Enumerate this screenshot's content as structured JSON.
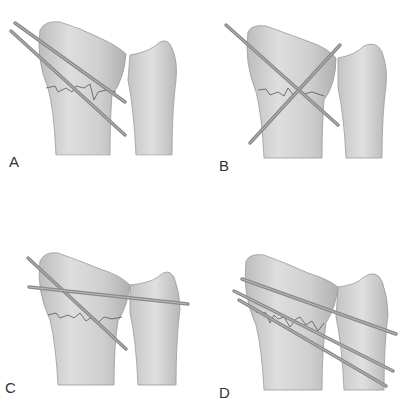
{
  "figure": {
    "panels": [
      {
        "id": "A",
        "label": "A",
        "description": "Two parallel pins crossing fracture, oblique"
      },
      {
        "id": "B",
        "label": "B",
        "description": "Two crossed pins forming an X across the fracture"
      },
      {
        "id": "C",
        "label": "C",
        "description": "One oblique pin plus one transverse pin into ulna"
      },
      {
        "id": "D",
        "label": "D",
        "description": "Three pins, including transverse pins into ulna"
      }
    ],
    "colors": {
      "bone": "#d2d2d2",
      "bone_shade": "#b4b4b4",
      "bone_outline": "#9a9a9a",
      "pin": "#8a8a8a",
      "pin_highlight": "#b8b8b8",
      "fracture_line": "#555555"
    }
  }
}
